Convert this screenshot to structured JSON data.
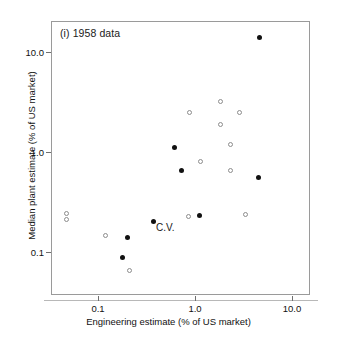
{
  "figure": {
    "panel_label": "(i) 1958 data",
    "annotation": "C.V."
  },
  "chart_data": {
    "type": "scatter",
    "title": "(i) 1958 data",
    "xlabel": "Engineering estimate (% of US market)",
    "ylabel": "Median plant estimate (% of US market)",
    "xscale": "log",
    "yscale": "log",
    "xlim": [
      0.035,
      16.0
    ],
    "ylim": [
      0.05,
      20.0
    ],
    "grid": false,
    "legend": null,
    "xticks": [
      0.1,
      1.0,
      10.0
    ],
    "xticklabels": [
      "0.1",
      "1.0",
      "10.0"
    ],
    "yticks": [
      0.1,
      1.0,
      10.0
    ],
    "yticklabels": [
      "0.1",
      "1.0",
      "10.0"
    ],
    "annotations": [
      {
        "text": "C.V.",
        "x": 0.37,
        "y": 0.2
      }
    ],
    "series": [
      {
        "name": "filled",
        "marker": "filled-circle",
        "color": "#111111",
        "points": [
          {
            "x": 4.6,
            "y": 14.0
          },
          {
            "x": 0.62,
            "y": 1.1
          },
          {
            "x": 0.73,
            "y": 0.66
          },
          {
            "x": 4.5,
            "y": 0.55
          },
          {
            "x": 1.1,
            "y": 0.23
          },
          {
            "x": 0.37,
            "y": 0.2
          },
          {
            "x": 0.2,
            "y": 0.14
          },
          {
            "x": 0.18,
            "y": 0.088
          }
        ]
      },
      {
        "name": "open",
        "marker": "open-circle",
        "color": "#8d8d8d",
        "points": [
          {
            "x": 1.85,
            "y": 3.2
          },
          {
            "x": 0.88,
            "y": 2.5
          },
          {
            "x": 2.9,
            "y": 2.5
          },
          {
            "x": 1.85,
            "y": 1.9
          },
          {
            "x": 2.3,
            "y": 1.2
          },
          {
            "x": 1.15,
            "y": 0.8
          },
          {
            "x": 2.3,
            "y": 0.66
          },
          {
            "x": 3.3,
            "y": 0.235
          },
          {
            "x": 0.85,
            "y": 0.225
          },
          {
            "x": 0.047,
            "y": 0.245
          },
          {
            "x": 0.047,
            "y": 0.21
          },
          {
            "x": 0.12,
            "y": 0.145
          },
          {
            "x": 0.21,
            "y": 0.065
          }
        ]
      }
    ]
  }
}
